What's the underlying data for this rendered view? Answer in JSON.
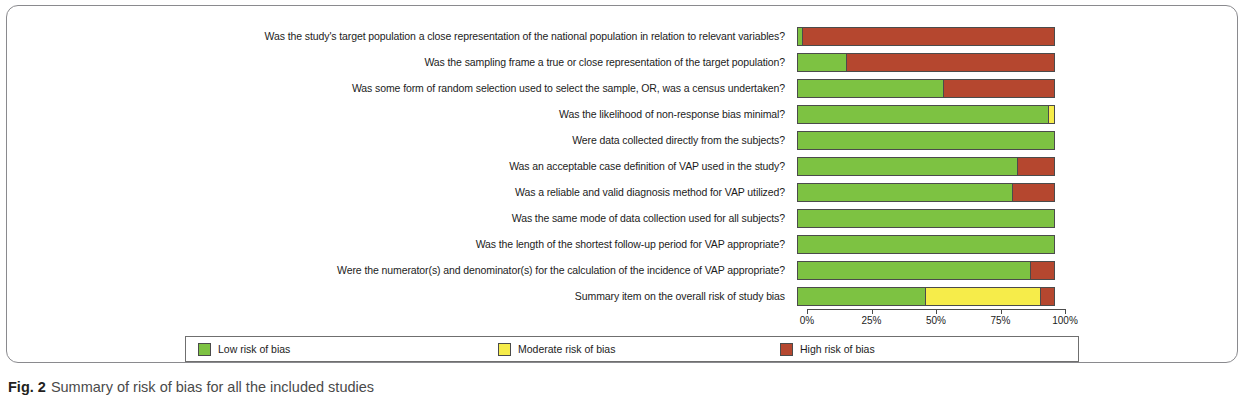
{
  "caption": {
    "label": "Fig. 2",
    "text": "Summary of risk of bias for all the included studies"
  },
  "legend": {
    "items": [
      {
        "label": "Low risk of bias",
        "color": "#7dc242"
      },
      {
        "label": "Moderate risk of bias",
        "color": "#f6ec4a"
      },
      {
        "label": "High risk of bias",
        "color": "#b5472f"
      }
    ]
  },
  "colors": {
    "low": "#7dc242",
    "moderate": "#f6ec4a",
    "high": "#b5472f",
    "outline": "#4b4b4b",
    "card_border": "#8a8a8e",
    "text": "#1c1c1c",
    "caption_text": "#4a4a4a"
  },
  "chart_data": {
    "type": "bar",
    "orientation": "horizontal",
    "stacked": true,
    "normalized": true,
    "title": "Summary of risk of bias for all the included studies",
    "xlabel": "",
    "ylabel": "",
    "xlim": [
      0,
      100
    ],
    "grid": false,
    "legend_position": "bottom",
    "tick_labels": [
      "0%",
      "25%",
      "50%",
      "75%",
      "100%"
    ],
    "tick_values": [
      0,
      25,
      50,
      75,
      100
    ],
    "series": [
      {
        "name": "Low risk of bias",
        "color": "#7dc242"
      },
      {
        "name": "Moderate risk of bias",
        "color": "#f6ec4a"
      },
      {
        "name": "High risk of bias",
        "color": "#b5472f"
      }
    ],
    "categories": [
      "Was the study's target population a close representation of the national population in relation to relevant variables?",
      "Was the sampling frame a true or close representation of the target population?",
      "Was some form of random selection used to select the sample, OR, was a census undertaken?",
      "Was the likelihood of non-response bias minimal?",
      "Were data collected directly from the subjects?",
      "Was an acceptable case definition of VAP used in the study?",
      "Was a reliable and valid diagnosis method for VAP utilized?",
      "Was the same mode of data collection used for all subjects?",
      "Was the length of the shortest follow-up period for VAP appropriate?",
      "Were the numerator(s) and denominator(s) for the calculation of the incidence of VAP appropriate?",
      "Summary item on the overall risk of study bias"
    ],
    "rows": [
      {
        "category": "Was the study's target population a close representation of the national population in relation to relevant variables?",
        "low": 2,
        "moderate": 0,
        "high": 98
      },
      {
        "category": "Was the sampling frame a true or close representation of the target population?",
        "low": 19,
        "moderate": 0,
        "high": 81
      },
      {
        "category": "Was some form of random selection used to select the sample, OR, was a census undertaken?",
        "low": 57,
        "moderate": 0,
        "high": 43
      },
      {
        "category": "Was the likelihood of non-response bias minimal?",
        "low": 98,
        "moderate": 2,
        "high": 0
      },
      {
        "category": "Were data collected directly from the subjects?",
        "low": 100,
        "moderate": 0,
        "high": 0
      },
      {
        "category": "Was an acceptable case definition of VAP used in the study?",
        "low": 86,
        "moderate": 0,
        "high": 14
      },
      {
        "category": "Was a reliable and valid diagnosis method for VAP utilized?",
        "low": 84,
        "moderate": 0,
        "high": 16
      },
      {
        "category": "Was the same mode of data collection used for all subjects?",
        "low": 100,
        "moderate": 0,
        "high": 0
      },
      {
        "category": "Was the length of the shortest follow-up period for VAP appropriate?",
        "low": 100,
        "moderate": 0,
        "high": 0
      },
      {
        "category": "Were the numerator(s) and denominator(s) for the calculation of the incidence of VAP appropriate?",
        "low": 91,
        "moderate": 0,
        "high": 9
      },
      {
        "category": "Summary item on the overall risk of study bias",
        "low": 50,
        "moderate": 45,
        "high": 5
      }
    ],
    "series_values": {
      "Low risk of bias": [
        2,
        19,
        57,
        98,
        100,
        86,
        84,
        100,
        100,
        91,
        50
      ],
      "Moderate risk of bias": [
        0,
        0,
        0,
        2,
        0,
        0,
        0,
        0,
        0,
        0,
        45
      ],
      "High risk of bias": [
        98,
        81,
        43,
        0,
        0,
        14,
        16,
        0,
        0,
        9,
        5
      ]
    }
  }
}
